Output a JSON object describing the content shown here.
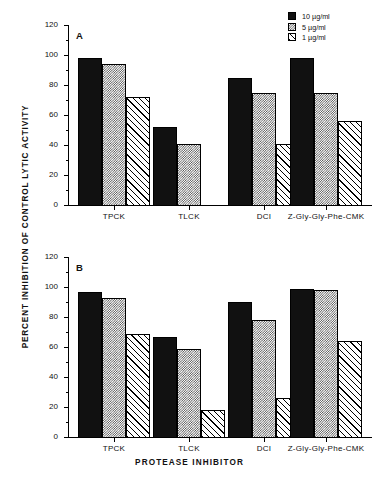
{
  "figure": {
    "y_axis_label": "PERCENT INHIBITION OF CONTROL LYTIC ACTIVITY",
    "x_axis_label": "PROTEASE INHIBITOR"
  },
  "legend": {
    "position": "top-right",
    "items": [
      {
        "label": "10 µg/ml",
        "pattern": "solid-black"
      },
      {
        "label": "5 µg/ml",
        "pattern": "gray-stipple"
      },
      {
        "label": "1 µg/ml",
        "pattern": "diagonal-hatch"
      }
    ]
  },
  "panels": [
    {
      "letter": "A"
    },
    {
      "letter": "B"
    }
  ],
  "axis": {
    "y_ticks": [
      "0",
      "20",
      "40",
      "60",
      "80",
      "100",
      "120"
    ],
    "x_ticks": [
      "TPCK",
      "TLCK",
      "DCI",
      "Z-Gly-Gly-Phe-CMK"
    ]
  },
  "chart_data": [
    {
      "type": "bar",
      "panel": "A",
      "title": "A",
      "xlabel": "PROTEASE INHIBITOR",
      "ylabel": "PERCENT INHIBITION OF CONTROL LYTIC ACTIVITY",
      "categories": [
        "TPCK",
        "TLCK",
        "DCI",
        "Z-Gly-Gly-Phe-CMK"
      ],
      "ylim": [
        0,
        120
      ],
      "ytick_step": 20,
      "yminor_step": 10,
      "grid": false,
      "legend_position": "top-right",
      "series": [
        {
          "name": "10 µg/ml",
          "pattern": "solid-black",
          "values": [
            98,
            52,
            85,
            98
          ]
        },
        {
          "name": "5 µg/ml",
          "pattern": "gray-stipple",
          "values": [
            94,
            41,
            75,
            75
          ]
        },
        {
          "name": "1 µg/ml",
          "pattern": "diagonal-hatch",
          "values": [
            72,
            null,
            41,
            56
          ]
        }
      ]
    },
    {
      "type": "bar",
      "panel": "B",
      "title": "B",
      "xlabel": "PROTEASE INHIBITOR",
      "ylabel": "PERCENT INHIBITION OF CONTROL LYTIC ACTIVITY",
      "categories": [
        "TPCK",
        "TLCK",
        "DCI",
        "Z-Gly-Gly-Phe-CMK"
      ],
      "ylim": [
        0,
        120
      ],
      "ytick_step": 20,
      "yminor_step": 10,
      "grid": false,
      "legend_position": "top-right",
      "series": [
        {
          "name": "10 µg/ml",
          "pattern": "solid-black",
          "values": [
            97,
            67,
            90,
            99
          ]
        },
        {
          "name": "5 µg/ml",
          "pattern": "gray-stipple",
          "values": [
            93,
            59,
            78,
            98
          ]
        },
        {
          "name": "1 µg/ml",
          "pattern": "diagonal-hatch",
          "values": [
            69,
            18,
            26,
            64
          ]
        }
      ]
    }
  ]
}
